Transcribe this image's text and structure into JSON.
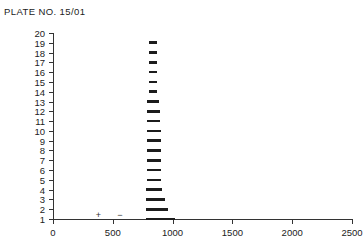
{
  "title": "PLATE NO. 15/01",
  "chart_data": {
    "type": "bar",
    "orientation": "horizontal",
    "title": "PLATE NO. 15/01",
    "xlabel": "",
    "ylabel": "",
    "xlim": [
      0,
      2500
    ],
    "ylim": [
      0,
      20
    ],
    "grid": false,
    "legend": false,
    "x_ticks": [
      0,
      500,
      1000,
      1500,
      2000,
      2500
    ],
    "x_tick_labels": [
      "0",
      "500",
      "1000",
      "1500",
      "2000",
      "2500"
    ],
    "y_ticks": [
      1,
      2,
      3,
      4,
      5,
      6,
      7,
      8,
      9,
      10,
      11,
      12,
      13,
      14,
      15,
      16,
      17,
      18,
      19,
      20
    ],
    "y_tick_labels": [
      "1",
      "2",
      "3",
      "4",
      "5",
      "6",
      "7",
      "8",
      "9",
      "10",
      "11",
      "12",
      "13",
      "14",
      "15",
      "16",
      "17",
      "18",
      "19",
      "20"
    ],
    "bar_style": "floating-range",
    "categories": [
      1,
      2,
      3,
      4,
      5,
      6,
      7,
      8,
      9,
      10,
      11,
      12,
      13,
      14,
      15,
      16,
      17,
      18,
      19,
      20
    ],
    "bars": [
      {
        "category": 1,
        "start": 775,
        "end": 1020
      },
      {
        "category": 2,
        "start": 775,
        "end": 960
      },
      {
        "category": 3,
        "start": 775,
        "end": 935
      },
      {
        "category": 4,
        "start": 775,
        "end": 915
      },
      {
        "category": 5,
        "start": 785,
        "end": 900
      },
      {
        "category": 6,
        "start": 785,
        "end": 900
      },
      {
        "category": 7,
        "start": 785,
        "end": 900
      },
      {
        "category": 8,
        "start": 785,
        "end": 900
      },
      {
        "category": 9,
        "start": 785,
        "end": 900
      },
      {
        "category": 10,
        "start": 785,
        "end": 900
      },
      {
        "category": 11,
        "start": 785,
        "end": 895
      },
      {
        "category": 12,
        "start": 785,
        "end": 895
      },
      {
        "category": 13,
        "start": 785,
        "end": 890
      },
      {
        "category": 14,
        "start": 800,
        "end": 870
      },
      {
        "category": 15,
        "start": 800,
        "end": 870
      },
      {
        "category": 16,
        "start": 800,
        "end": 870
      },
      {
        "category": 17,
        "start": 800,
        "end": 870
      },
      {
        "category": 18,
        "start": 800,
        "end": 870
      },
      {
        "category": 19,
        "start": 800,
        "end": 870
      },
      {
        "category": 20,
        "start": null,
        "end": null
      }
    ],
    "values": [
      1020,
      960,
      935,
      915,
      900,
      900,
      900,
      900,
      900,
      900,
      895,
      895,
      890,
      870,
      870,
      870,
      870,
      870,
      870,
      null
    ],
    "annotations": [
      {
        "label": "+",
        "x": 380,
        "y": 1.4
      },
      {
        "label": "−",
        "x": 560,
        "y": 1.4
      }
    ]
  },
  "colors": {
    "bar": "#1c1c1c",
    "axis": "#333333",
    "text": "#222222",
    "background": "#ffffff"
  }
}
